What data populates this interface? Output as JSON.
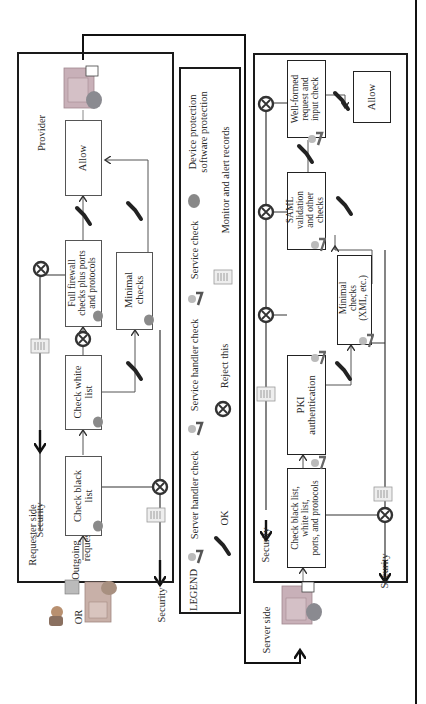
{
  "diagram": {
    "orientation": "rotated 90° counter-clockwise",
    "requester_section": {
      "side_label": "Requester side",
      "provider_label": "Provider",
      "or_label": "OR",
      "outgoing_label": [
        "Outgoing",
        "request"
      ],
      "security_label_top": "Security",
      "security_label_bottom": "Security",
      "boxes": [
        {
          "id": "check-black-list",
          "label": [
            "Check black",
            "list"
          ]
        },
        {
          "id": "check-white-list",
          "label": [
            "Check white",
            "list"
          ]
        },
        {
          "id": "full-firewall",
          "label": [
            "Full firewall",
            "checks plus ports",
            "and protocols"
          ]
        },
        {
          "id": "minimal-checks",
          "label": [
            "Minimal",
            "checks"
          ]
        },
        {
          "id": "allow",
          "label": [
            "Allow"
          ]
        }
      ]
    },
    "legend": {
      "title": "LEGEND",
      "items": [
        {
          "icon": "server-handler-icon",
          "label": "Server handler check"
        },
        {
          "icon": "service-handler-icon",
          "label": "Service handler check"
        },
        {
          "icon": "service-check-icon",
          "label": "Service check"
        },
        {
          "icon": "device-protection-icon",
          "label": [
            "Device protection",
            "software protection"
          ]
        },
        {
          "icon": "ok-check-icon",
          "label": "OK"
        },
        {
          "icon": "reject-icon",
          "label": "Reject this"
        },
        {
          "icon": "monitor-records-icon",
          "label": "Monitor and alert records"
        }
      ]
    },
    "server_section": {
      "side_label": "Server side",
      "incoming_label": [
        "Incoming",
        "request"
      ],
      "security_label_top": "Security",
      "security_label_bottom": "Security",
      "boxes": [
        {
          "id": "check-lists-ports",
          "label": [
            "Check black list,",
            "white list,",
            "ports, and protocols"
          ]
        },
        {
          "id": "pki-auth",
          "label": [
            "PKI",
            "authentication"
          ]
        },
        {
          "id": "minimal-checks-xml",
          "label": [
            "Minimal",
            "checks",
            "(XML, etc.)"
          ]
        },
        {
          "id": "saml-validation",
          "label": [
            "SAML",
            "validation",
            "and other",
            "checks"
          ]
        },
        {
          "id": "well-formed",
          "label": [
            "Well-formed",
            "request and",
            "input check"
          ]
        },
        {
          "id": "allow-server",
          "label": [
            "Allow"
          ]
        }
      ]
    },
    "colors": {
      "frame": "#1a1a1a",
      "box_border": "#555555",
      "reject_ring": "#333333",
      "text": "#2a2a2a"
    }
  }
}
